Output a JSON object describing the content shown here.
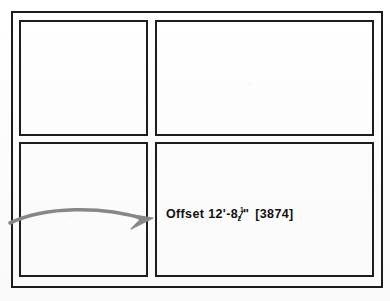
{
  "drawing": {
    "title": "CAD drawing sheet with four viewports",
    "frame": {
      "name": "sheet-border"
    },
    "panels": [
      {
        "id": "top-left",
        "label": ""
      },
      {
        "id": "top-right",
        "label": ""
      },
      {
        "id": "bottom-left",
        "label": ""
      },
      {
        "id": "bottom-right",
        "label": ""
      }
    ],
    "annotation": {
      "prefix": "Offset",
      "feet": "12'",
      "dash": "-",
      "inches_whole": "8",
      "fraction_numerator": "1",
      "fraction_denominator": "2",
      "inch_mark": "\"",
      "metric": "[3874]",
      "full_text": "Offset 12'-8½\" [3874]",
      "text_color": "#111111"
    },
    "leader_arrow": {
      "name": "curved-leader-arrow",
      "color": "#878787",
      "direction": "left-to-right",
      "points_to": "bottom-right-panel"
    },
    "colors": {
      "background": "#fdfdfd",
      "border": "#1b1b1b",
      "panel_border": "#1d1d1d",
      "arrow": "#878787"
    }
  }
}
